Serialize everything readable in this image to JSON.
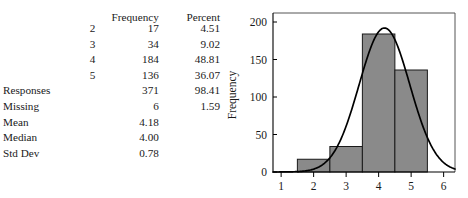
{
  "table": {
    "headers": [
      "",
      "",
      "Frequency",
      "Percent"
    ],
    "rows": [
      {
        "label": "",
        "key": "2",
        "frequency": "17",
        "percent": "4.51"
      },
      {
        "label": "",
        "key": "3",
        "frequency": "34",
        "percent": "9.02"
      },
      {
        "label": "",
        "key": "4",
        "frequency": "184",
        "percent": "48.81"
      },
      {
        "label": "",
        "key": "5",
        "frequency": "136",
        "percent": "36.07"
      },
      {
        "label": "Responses",
        "key": "",
        "frequency": "371",
        "percent": "98.41"
      },
      {
        "label": "Missing",
        "key": "",
        "frequency": "6",
        "percent": "1.59"
      },
      {
        "label": "Mean",
        "key": "",
        "frequency": "4.18",
        "percent": ""
      },
      {
        "label": "Median",
        "key": "",
        "frequency": "4.00",
        "percent": ""
      },
      {
        "label": "Std Dev",
        "key": "",
        "frequency": "0.78",
        "percent": ""
      }
    ]
  },
  "chart_data": {
    "type": "bar",
    "title": "",
    "xlabel": "",
    "ylabel": "Frequency",
    "categories": [
      "2",
      "3",
      "4",
      "5"
    ],
    "values": [
      17,
      34,
      184,
      136
    ],
    "bin_edges": [
      1.5,
      2.5,
      3.5,
      4.5,
      5.5
    ],
    "xlim": [
      0.75,
      6.35
    ],
    "ylim": [
      0,
      212
    ],
    "x_ticks": [
      "1",
      "2",
      "3",
      "4",
      "5",
      "6"
    ],
    "x_tick_values": [
      1,
      2,
      3,
      4,
      5,
      6
    ],
    "y_ticks": [
      "0",
      "50",
      "100",
      "150",
      "200"
    ],
    "y_tick_values": [
      0,
      50,
      100,
      150,
      200
    ],
    "grid": false,
    "legend": null,
    "overlay": {
      "type": "line",
      "name": "normal curve",
      "mean": 4.18,
      "std_dev": 0.78,
      "peak_value": 192
    },
    "colors": {
      "bar_fill": "#8a8a8a",
      "bar_edge": "#1a1a1a",
      "curve": "#000000",
      "frame": "#555555"
    }
  }
}
